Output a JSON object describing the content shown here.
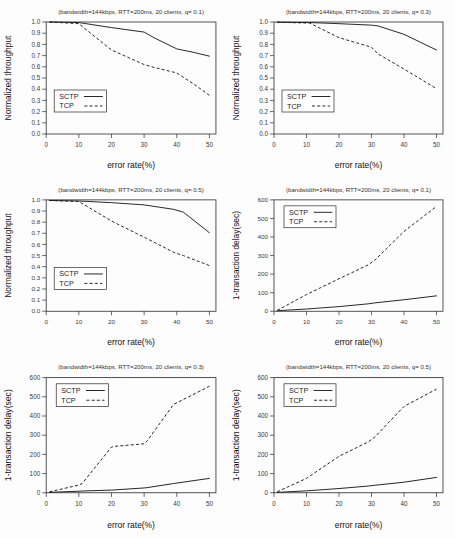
{
  "figure": {
    "caption": "",
    "panel_count": 6
  },
  "axis_labels": {
    "x": "error rate(%)",
    "y_throughput": "Normalized throughput",
    "y_delay": "1-transaction delay(sec)"
  },
  "legend": {
    "sctp": "SCTP",
    "tcp": "TCP"
  },
  "colors": {
    "line": "#1d1d1d",
    "axis": "#2b2b2b",
    "background": "#ffffff",
    "panel_background": "#fdfdfd"
  },
  "chart_data": [
    {
      "id": "throughput-q01",
      "type": "line",
      "title": "(bandwidth=144kbps, RTT=200ms, 20 clients, q= 0.1)",
      "xlabel": "error rate(%)",
      "ylabel": "Normalized throughput",
      "xlim": [
        0,
        52
      ],
      "ylim": [
        0.0,
        1.0
      ],
      "xticks": [
        0,
        10,
        20,
        30,
        40,
        50
      ],
      "yticks": [
        0.0,
        0.1,
        0.2,
        0.3,
        0.4,
        0.5,
        0.6,
        0.7,
        0.8,
        0.9,
        1.0
      ],
      "ytick_labels": [
        "0.0",
        "0.1",
        "0.2",
        "0.3",
        "0.4",
        "0.5",
        "0.6",
        "0.7",
        "0.8",
        "0.9",
        "1.0"
      ],
      "grid": false,
      "legend_position": "lower-left",
      "x": [
        1,
        10,
        20,
        30,
        33,
        40,
        45,
        50
      ],
      "series": [
        {
          "name": "SCTP",
          "style": "solid",
          "values": [
            1.0,
            0.995,
            0.95,
            0.91,
            0.86,
            0.76,
            0.73,
            0.695
          ]
        },
        {
          "name": "TCP",
          "style": "dashed",
          "values": [
            1.0,
            0.985,
            0.75,
            0.62,
            0.595,
            0.545,
            0.45,
            0.345
          ]
        }
      ]
    },
    {
      "id": "throughput-q03",
      "type": "line",
      "title": "(bandwidth=144kbps, RTT=200ms, 20 clients, q= 0.3)",
      "xlabel": "error rate(%)",
      "ylabel": "Normalized throughput",
      "xlim": [
        0,
        52
      ],
      "ylim": [
        0.0,
        1.0
      ],
      "xticks": [
        0,
        10,
        20,
        30,
        40,
        50
      ],
      "yticks": [
        0.0,
        0.1,
        0.2,
        0.3,
        0.4,
        0.5,
        0.6,
        0.7,
        0.8,
        0.9,
        1.0
      ],
      "ytick_labels": [
        "0.0",
        "0.1",
        "0.2",
        "0.3",
        "0.4",
        "0.5",
        "0.6",
        "0.7",
        "0.8",
        "0.9",
        "1.0"
      ],
      "grid": false,
      "legend_position": "lower-left",
      "x": [
        1,
        11,
        20,
        30,
        32,
        40,
        50
      ],
      "series": [
        {
          "name": "SCTP",
          "style": "solid",
          "values": [
            0.998,
            0.995,
            0.985,
            0.972,
            0.965,
            0.89,
            0.75
          ]
        },
        {
          "name": "TCP",
          "style": "dashed",
          "values": [
            0.998,
            0.99,
            0.86,
            0.775,
            0.715,
            0.58,
            0.405
          ]
        }
      ]
    },
    {
      "id": "throughput-q05",
      "type": "line",
      "title": "(bandwidth=144kbps, RTT=200ms, 20 clients, q= 0.5)",
      "xlabel": "error rate(%)",
      "ylabel": "Normalized throughput",
      "xlim": [
        0,
        52
      ],
      "ylim": [
        0.0,
        1.0
      ],
      "xticks": [
        0,
        10,
        20,
        30,
        40,
        50
      ],
      "yticks": [
        0.0,
        0.1,
        0.2,
        0.3,
        0.4,
        0.5,
        0.6,
        0.7,
        0.8,
        0.9,
        1.0
      ],
      "ytick_labels": [
        "0.0",
        "0.1",
        "0.2",
        "0.3",
        "0.4",
        "0.5",
        "0.6",
        "0.7",
        "0.8",
        "0.9",
        "1.0"
      ],
      "grid": false,
      "legend_position": "lower-left",
      "x": [
        1,
        10,
        20,
        30,
        39,
        42,
        50
      ],
      "series": [
        {
          "name": "SCTP",
          "style": "solid",
          "values": [
            0.995,
            0.99,
            0.975,
            0.955,
            0.915,
            0.89,
            0.705
          ]
        },
        {
          "name": "TCP",
          "style": "dashed",
          "values": [
            0.995,
            0.985,
            0.81,
            0.665,
            0.53,
            0.5,
            0.41
          ]
        }
      ]
    },
    {
      "id": "delay-q01",
      "type": "line",
      "title": "(bandwidth=144kbps, RTT=200ms, 20 clients, q= 0.1)",
      "xlabel": "error rate(%)",
      "ylabel": "1-transaction delay(sec)",
      "xlim": [
        0,
        52
      ],
      "ylim": [
        0,
        600
      ],
      "xticks": [
        0,
        10,
        20,
        30,
        40,
        50
      ],
      "yticks": [
        0,
        100,
        200,
        300,
        400,
        500,
        600
      ],
      "ytick_labels": [
        "0",
        "100",
        "200",
        "300",
        "400",
        "500",
        "600"
      ],
      "grid": false,
      "legend_position": "upper-left",
      "x": [
        1,
        10,
        20,
        29,
        31,
        40,
        50
      ],
      "series": [
        {
          "name": "SCTP",
          "style": "solid",
          "values": [
            3,
            12,
            25,
            40,
            45,
            62,
            83
          ]
        },
        {
          "name": "TCP",
          "style": "dashed",
          "values": [
            5,
            90,
            175,
            250,
            275,
            430,
            565
          ]
        }
      ]
    },
    {
      "id": "delay-q03",
      "type": "line",
      "title": "(bandwidth=144kbps, RTT=200ms, 20 clients, q= 0.3)",
      "xlabel": "error rate(%)",
      "ylabel": "1-transaction delay(sec)",
      "xlim": [
        0,
        52
      ],
      "ylim": [
        0,
        600
      ],
      "xticks": [
        0,
        10,
        20,
        30,
        40,
        50
      ],
      "yticks": [
        0,
        100,
        200,
        300,
        400,
        500,
        600
      ],
      "ytick_labels": [
        "0",
        "100",
        "200",
        "300",
        "400",
        "500",
        "600"
      ],
      "grid": false,
      "legend_position": "upper-left",
      "x": [
        1,
        10,
        11,
        20,
        21,
        30,
        31,
        39,
        50
      ],
      "series": [
        {
          "name": "SCTP",
          "style": "solid",
          "values": [
            2,
            8,
            9,
            14,
            15,
            25,
            27,
            48,
            75
          ]
        },
        {
          "name": "TCP",
          "style": "dashed",
          "values": [
            5,
            40,
            48,
            238,
            242,
            255,
            272,
            460,
            555
          ]
        }
      ]
    },
    {
      "id": "delay-q05",
      "type": "line",
      "title": "(bandwidth=144kbps, RTT=200ms, 20 clients, q= 0.5)",
      "xlabel": "error rate(%)",
      "ylabel": "1-transaction delay(sec)",
      "xlim": [
        0,
        52
      ],
      "ylim": [
        0,
        600
      ],
      "xticks": [
        0,
        10,
        20,
        30,
        40,
        50
      ],
      "yticks": [
        0,
        100,
        200,
        300,
        400,
        500,
        600
      ],
      "ytick_labels": [
        "0",
        "100",
        "200",
        "300",
        "400",
        "500",
        "600"
      ],
      "grid": false,
      "legend_position": "upper-left",
      "x": [
        1,
        10,
        20,
        29,
        31,
        40,
        50
      ],
      "series": [
        {
          "name": "SCTP",
          "style": "solid",
          "values": [
            2,
            10,
            22,
            35,
            39,
            55,
            80
          ]
        },
        {
          "name": "TCP",
          "style": "dashed",
          "values": [
            5,
            75,
            190,
            265,
            290,
            450,
            540
          ]
        }
      ]
    }
  ]
}
